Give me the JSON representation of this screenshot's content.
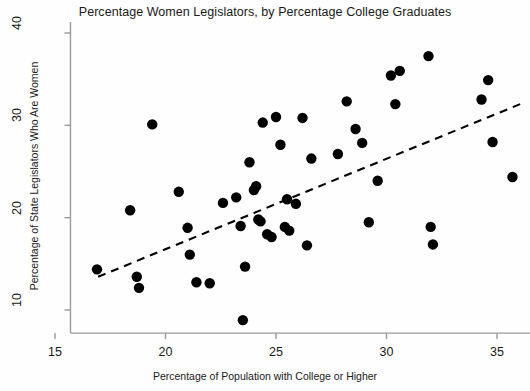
{
  "chart_data": {
    "type": "scatter",
    "title": "Percentage Women Legislators, by Percentage College Graduates",
    "xlabel": "Percentage of Population with College or Higher",
    "ylabel": "Percentage of State Legislators Who Are Women",
    "xlim": [
      15.7,
      36.5
    ],
    "ylim": [
      7.5,
      41.2
    ],
    "xticks": [
      15,
      20,
      25,
      30,
      35
    ],
    "yticks": [
      10,
      20,
      30,
      40
    ],
    "grid": false,
    "legend": null,
    "marker": {
      "shape": "circle",
      "color": "#000000",
      "size": 5.2
    },
    "points": [
      {
        "x": 16.9,
        "y": 14.4
      },
      {
        "x": 18.4,
        "y": 20.8
      },
      {
        "x": 18.7,
        "y": 13.6
      },
      {
        "x": 18.8,
        "y": 12.4
      },
      {
        "x": 19.4,
        "y": 30.1
      },
      {
        "x": 20.6,
        "y": 22.8
      },
      {
        "x": 21.0,
        "y": 18.9
      },
      {
        "x": 21.1,
        "y": 16.0
      },
      {
        "x": 21.4,
        "y": 13.0
      },
      {
        "x": 22.0,
        "y": 12.9
      },
      {
        "x": 22.6,
        "y": 21.6
      },
      {
        "x": 23.2,
        "y": 22.2
      },
      {
        "x": 23.4,
        "y": 19.1
      },
      {
        "x": 23.5,
        "y": 8.9
      },
      {
        "x": 23.6,
        "y": 14.7
      },
      {
        "x": 23.8,
        "y": 26.0
      },
      {
        "x": 24.0,
        "y": 23.0
      },
      {
        "x": 24.1,
        "y": 23.4
      },
      {
        "x": 24.2,
        "y": 19.8
      },
      {
        "x": 24.3,
        "y": 19.6
      },
      {
        "x": 24.4,
        "y": 30.3
      },
      {
        "x": 24.6,
        "y": 18.2
      },
      {
        "x": 24.8,
        "y": 17.9
      },
      {
        "x": 25.0,
        "y": 30.9
      },
      {
        "x": 25.2,
        "y": 27.9
      },
      {
        "x": 25.4,
        "y": 19.0
      },
      {
        "x": 25.5,
        "y": 22.0
      },
      {
        "x": 25.6,
        "y": 18.6
      },
      {
        "x": 25.9,
        "y": 21.5
      },
      {
        "x": 26.2,
        "y": 30.8
      },
      {
        "x": 26.4,
        "y": 17.0
      },
      {
        "x": 26.6,
        "y": 26.4
      },
      {
        "x": 27.8,
        "y": 26.9
      },
      {
        "x": 28.2,
        "y": 32.6
      },
      {
        "x": 28.6,
        "y": 29.6
      },
      {
        "x": 28.9,
        "y": 28.1
      },
      {
        "x": 29.2,
        "y": 19.5
      },
      {
        "x": 29.6,
        "y": 24.0
      },
      {
        "x": 30.2,
        "y": 35.4
      },
      {
        "x": 30.4,
        "y": 32.3
      },
      {
        "x": 30.6,
        "y": 35.9
      },
      {
        "x": 31.9,
        "y": 37.5
      },
      {
        "x": 32.0,
        "y": 19.0
      },
      {
        "x": 32.1,
        "y": 17.1
      },
      {
        "x": 34.3,
        "y": 32.8
      },
      {
        "x": 34.6,
        "y": 34.9
      },
      {
        "x": 34.8,
        "y": 28.2
      },
      {
        "x": 35.7,
        "y": 24.4
      }
    ],
    "trendline": {
      "style": "dashed",
      "color": "#000000",
      "x_start": 16.95,
      "y_start": 13.6,
      "x_end": 36.05,
      "y_end": 32.3
    }
  }
}
